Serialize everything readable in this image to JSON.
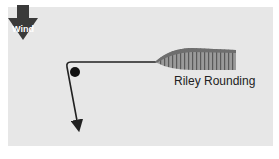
{
  "diagram": {
    "wind_label": "Wind",
    "boat_label": "Riley Rounding",
    "colors": {
      "panel": "#e7e7e7",
      "wind_arrow": "#3a3a3a",
      "hull_fill": "#8a8a8a",
      "hull_top": "#666666",
      "line": "#222222",
      "mark": "#111111"
    },
    "elements": [
      "wind-arrow",
      "boat",
      "course-line",
      "mark-buoy"
    ]
  }
}
